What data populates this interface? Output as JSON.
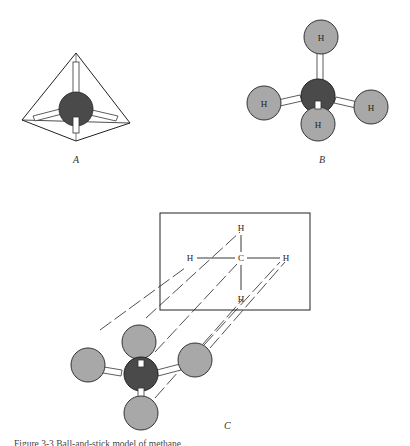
{
  "figure": {
    "panels": [
      {
        "label": "A",
        "description": "Carbon atom at center of a tetrahedron with four bonds pointing to the vertices"
      },
      {
        "label": "B",
        "description": "Ball-and-stick model of methane",
        "atom_labels": [
          "H",
          "H",
          "H",
          "H"
        ]
      },
      {
        "label": "C",
        "description": "Projection of ball-and-stick methane model onto a plane",
        "projection_labels": {
          "top": "H",
          "left": "H",
          "center": "C",
          "right": "H",
          "bottom": "H"
        }
      }
    ],
    "caption": "Figure 3-3 Ball-and-stick model of methane..."
  },
  "colors": {
    "carbon": "#4a4a4a",
    "hydrogen": "#a8a8a8",
    "bond": "#ffffff",
    "line": "#222222"
  }
}
